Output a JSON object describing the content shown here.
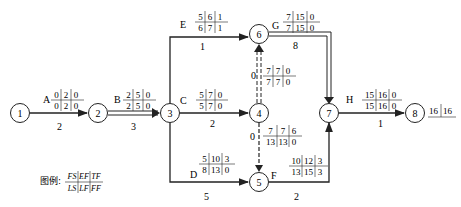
{
  "diagram": {
    "type": "double-code network (activity-on-arrow) with time parameters",
    "nodes": [
      {
        "id": "1",
        "x": 20,
        "y": 113
      },
      {
        "id": "2",
        "x": 98,
        "y": 113
      },
      {
        "id": "3",
        "x": 170,
        "y": 113
      },
      {
        "id": "4",
        "x": 259,
        "y": 113
      },
      {
        "id": "5",
        "x": 259,
        "y": 182
      },
      {
        "id": "6",
        "x": 259,
        "y": 34
      },
      {
        "id": "7",
        "x": 329,
        "y": 113
      },
      {
        "id": "8",
        "x": 415,
        "y": 113
      }
    ],
    "activities": [
      {
        "name": "A",
        "from": "1",
        "to": "2",
        "duration": "2",
        "top": [
          "0",
          "2",
          "0"
        ],
        "bottom": [
          "0",
          "2",
          "0"
        ],
        "critical": false
      },
      {
        "name": "B",
        "from": "2",
        "to": "3",
        "duration": "3",
        "top": [
          "2",
          "5",
          "0"
        ],
        "bottom": [
          "2",
          "5",
          "0"
        ],
        "critical": true
      },
      {
        "name": "C",
        "from": "3",
        "to": "4",
        "duration": "2",
        "top": [
          "5",
          "7",
          "0"
        ],
        "bottom": [
          "5",
          "7",
          "0"
        ],
        "critical": false
      },
      {
        "name": "D",
        "from": "3",
        "to": "5",
        "duration": "5",
        "top": [
          "5",
          "10",
          "3"
        ],
        "bottom": [
          "8",
          "13",
          "0"
        ],
        "critical": false
      },
      {
        "name": "E",
        "from": "3",
        "to": "6",
        "duration": "1",
        "top": [
          "5",
          "6",
          "1"
        ],
        "bottom": [
          "6",
          "7",
          "1"
        ],
        "critical": false
      },
      {
        "name": "F",
        "from": "5",
        "to": "7",
        "duration": "2",
        "top": [
          "10",
          "12",
          "3"
        ],
        "bottom": [
          "13",
          "15",
          "3"
        ],
        "critical": false
      },
      {
        "name": "G",
        "from": "6",
        "to": "7",
        "duration": "8",
        "top": [
          "7",
          "15",
          "0"
        ],
        "bottom": [
          "7",
          "15",
          "0"
        ],
        "critical": true
      },
      {
        "name": "H",
        "from": "7",
        "to": "8",
        "duration": "1",
        "top": [
          "15",
          "16",
          "0"
        ],
        "bottom": [
          "15",
          "16",
          "0"
        ],
        "critical": false
      },
      {
        "name": "",
        "from": "4",
        "to": "6",
        "duration": "0",
        "dummy": true,
        "top": [
          "7",
          "7",
          "0"
        ],
        "bottom": [
          "7",
          "7",
          "0"
        ],
        "critical": true
      },
      {
        "name": "",
        "from": "4",
        "to": "5",
        "duration": "0",
        "dummy": true,
        "top": [
          "7",
          "7",
          "6"
        ],
        "bottom": [
          "13",
          "13",
          "0"
        ],
        "critical": false
      }
    ],
    "end_node_values": [
      "16",
      "16"
    ],
    "legend": {
      "label": "图例:",
      "top": [
        "FS",
        "EF",
        "TF"
      ],
      "bottom": [
        "LS",
        "LF",
        "FF"
      ]
    }
  }
}
